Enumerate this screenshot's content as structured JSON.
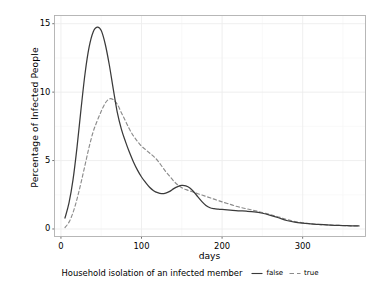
{
  "chart_data": {
    "type": "line",
    "title": "",
    "xlabel": "days",
    "ylabel": "Percentage of Infected People",
    "xlim": [
      -8,
      378
    ],
    "ylim": [
      -0.55,
      15.6
    ],
    "xticks": [
      "0",
      "100",
      "200",
      "300"
    ],
    "xtick_values": [
      0,
      100,
      200,
      300
    ],
    "yticks": [
      "0",
      "5",
      "10",
      "15"
    ],
    "ytick_values": [
      0,
      5,
      10,
      15
    ],
    "grid": true,
    "legend_position": "bottom",
    "legend_title": "Household isolation of an infected member",
    "series": [
      {
        "name": "false",
        "label": "false",
        "linestyle": "solid",
        "color": "#3a3a3a",
        "x": [
          5,
          10,
          15,
          20,
          25,
          30,
          35,
          40,
          45,
          50,
          55,
          60,
          65,
          70,
          75,
          80,
          85,
          90,
          95,
          100,
          105,
          110,
          115,
          120,
          125,
          130,
          135,
          140,
          145,
          150,
          155,
          160,
          165,
          170,
          175,
          180,
          185,
          190,
          195,
          200,
          210,
          220,
          230,
          240,
          250,
          260,
          270,
          280,
          290,
          300,
          310,
          320,
          330,
          340,
          350,
          360,
          370
        ],
        "y": [
          0.8,
          1.9,
          3.6,
          6.0,
          8.8,
          11.4,
          13.3,
          14.4,
          14.75,
          14.5,
          13.5,
          12.0,
          10.2,
          8.5,
          7.3,
          6.4,
          5.6,
          4.9,
          4.3,
          3.8,
          3.4,
          3.05,
          2.8,
          2.65,
          2.58,
          2.62,
          2.75,
          2.95,
          3.1,
          3.18,
          3.15,
          3.0,
          2.7,
          2.35,
          2.0,
          1.72,
          1.55,
          1.48,
          1.45,
          1.43,
          1.38,
          1.33,
          1.3,
          1.25,
          1.15,
          1.0,
          0.82,
          0.62,
          0.5,
          0.43,
          0.38,
          0.33,
          0.3,
          0.27,
          0.25,
          0.23,
          0.22
        ]
      },
      {
        "name": "true",
        "label": "true",
        "linestyle": "dashed",
        "color": "#8c8c8c",
        "x": [
          5,
          10,
          15,
          20,
          25,
          30,
          35,
          40,
          45,
          50,
          55,
          60,
          65,
          70,
          75,
          80,
          85,
          90,
          95,
          100,
          105,
          110,
          115,
          120,
          125,
          130,
          135,
          140,
          145,
          150,
          155,
          160,
          165,
          170,
          175,
          180,
          185,
          190,
          195,
          200,
          210,
          220,
          230,
          240,
          250,
          260,
          270,
          280,
          290,
          300,
          310,
          320,
          330,
          340,
          350,
          360,
          370
        ],
        "y": [
          0.1,
          0.5,
          1.2,
          2.2,
          3.4,
          4.7,
          6.0,
          7.1,
          7.9,
          8.6,
          9.2,
          9.5,
          9.45,
          9.1,
          8.5,
          7.9,
          7.3,
          6.8,
          6.4,
          6.05,
          5.8,
          5.55,
          5.3,
          5.0,
          4.6,
          4.2,
          3.85,
          3.5,
          3.22,
          3.02,
          2.88,
          2.78,
          2.68,
          2.58,
          2.48,
          2.38,
          2.28,
          2.18,
          2.08,
          1.98,
          1.8,
          1.62,
          1.48,
          1.35,
          1.2,
          1.05,
          0.88,
          0.7,
          0.55,
          0.45,
          0.38,
          0.33,
          0.3,
          0.27,
          0.25,
          0.23,
          0.22
        ]
      }
    ]
  },
  "axes": {
    "x_title": "days",
    "y_title": "Percentage of Infected People"
  },
  "legend": {
    "title": "Household isolation of an infected member",
    "items": [
      {
        "label": "false",
        "style": "solid"
      },
      {
        "label": "true",
        "style": "dashed"
      }
    ]
  },
  "colors": {
    "series_false": "#3a3a3a",
    "series_true": "#8c8c8c",
    "panel_border": "#b0b0b0",
    "grid_major": "#ededed",
    "grid_minor": "#f6f6f6",
    "background": "#ffffff",
    "text": "#000000"
  }
}
